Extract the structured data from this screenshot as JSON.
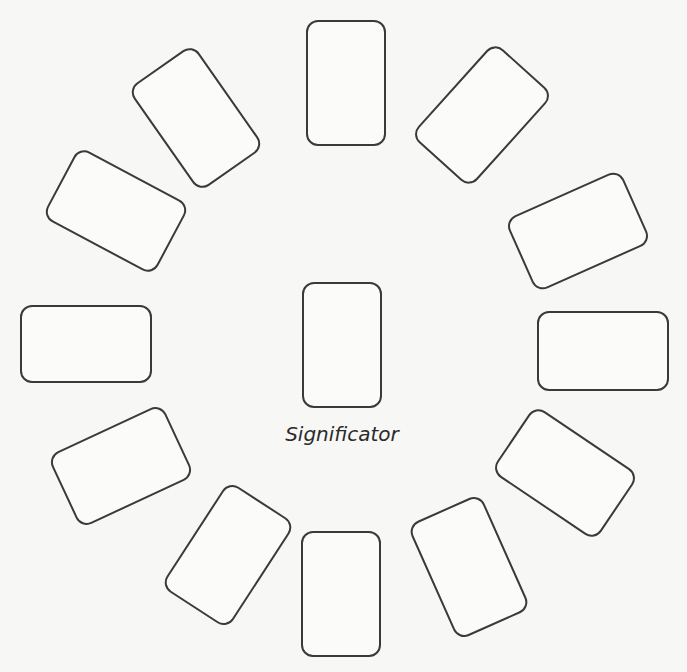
{
  "diagram": {
    "title": "",
    "center_label": "Significator",
    "colors": {
      "background": "#f7f7f5",
      "card_stroke": "#3a3a3a",
      "card_fill": "#fbfbfa",
      "text": "#2a2a2a"
    },
    "cards": [
      {
        "id": "center",
        "cx": 342,
        "cy": 345,
        "w": 80,
        "h": 126,
        "rot": 0
      },
      {
        "id": "top",
        "cx": 346,
        "cy": 83,
        "w": 80,
        "h": 126,
        "rot": 0
      },
      {
        "id": "upper-right",
        "cx": 482,
        "cy": 115,
        "w": 80,
        "h": 126,
        "rot": 42
      },
      {
        "id": "right-upper",
        "cx": 578,
        "cy": 231,
        "w": 126,
        "h": 80,
        "rot": -24
      },
      {
        "id": "right",
        "cx": 603,
        "cy": 351,
        "w": 132,
        "h": 80,
        "rot": 0
      },
      {
        "id": "right-lower",
        "cx": 565,
        "cy": 473,
        "w": 80,
        "h": 126,
        "rot": -56
      },
      {
        "id": "lower-right",
        "cx": 469,
        "cy": 567,
        "w": 80,
        "h": 126,
        "rot": -24
      },
      {
        "id": "bottom",
        "cx": 341,
        "cy": 594,
        "w": 80,
        "h": 126,
        "rot": 0
      },
      {
        "id": "lower-left",
        "cx": 228,
        "cy": 555,
        "w": 80,
        "h": 126,
        "rot": 33
      },
      {
        "id": "left-lower",
        "cx": 121,
        "cy": 466,
        "w": 126,
        "h": 80,
        "rot": -25
      },
      {
        "id": "left",
        "cx": 86,
        "cy": 344,
        "w": 132,
        "h": 78,
        "rot": 0
      },
      {
        "id": "left-upper",
        "cx": 116,
        "cy": 211,
        "w": 126,
        "h": 80,
        "rot": 28
      },
      {
        "id": "upper-left",
        "cx": 196,
        "cy": 118,
        "w": 80,
        "h": 126,
        "rot": -35
      }
    ]
  }
}
